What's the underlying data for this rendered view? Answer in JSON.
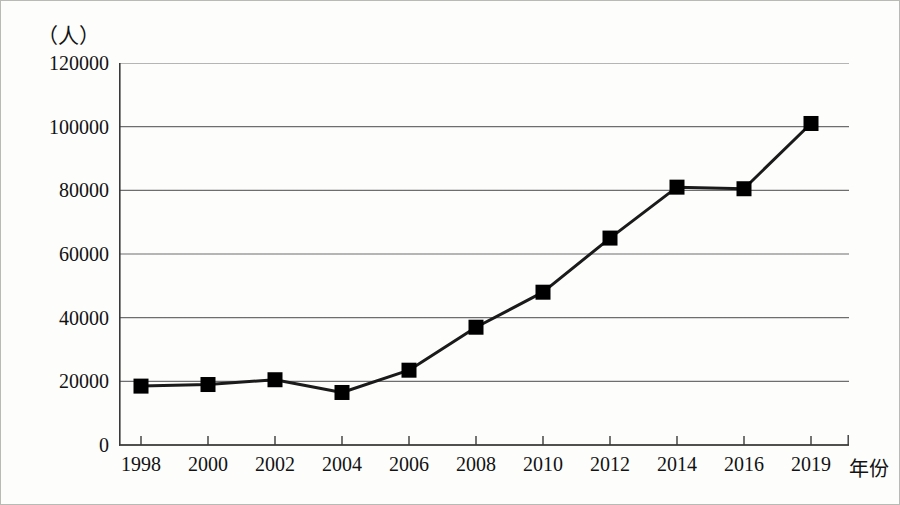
{
  "chart_data": {
    "type": "line",
    "title": "",
    "xlabel": "年份",
    "ylabel": "（人）",
    "unit_caption": "（人）",
    "categories": [
      "1998",
      "2000",
      "2002",
      "2004",
      "2006",
      "2008",
      "2010",
      "2012",
      "2014",
      "2016",
      "2019"
    ],
    "values": [
      18500,
      19000,
      20500,
      16500,
      23500,
      37000,
      48000,
      65000,
      81000,
      80500,
      101000
    ],
    "series": [
      {
        "name": "人数",
        "values": [
          18500,
          19000,
          20500,
          16500,
          23500,
          37000,
          48000,
          65000,
          81000,
          80500,
          101000
        ]
      }
    ],
    "ylim": [
      0,
      120000
    ],
    "yticks": [
      "0",
      "20000",
      "40000",
      "60000",
      "80000",
      "100000",
      "120000"
    ],
    "ytick_values": [
      0,
      20000,
      40000,
      60000,
      80000,
      100000,
      120000
    ],
    "xticks": [
      "1998",
      "2000",
      "2002",
      "2004",
      "2006",
      "2008",
      "2010",
      "2012",
      "2014",
      "2016",
      "2019"
    ],
    "grid": "horizontal",
    "legend": "none",
    "marker": "square",
    "line_color": "#1a1a1a",
    "marker_color": "#000000",
    "grid_color": "#6e6e6e",
    "axis_color": "#3a3a3a"
  }
}
